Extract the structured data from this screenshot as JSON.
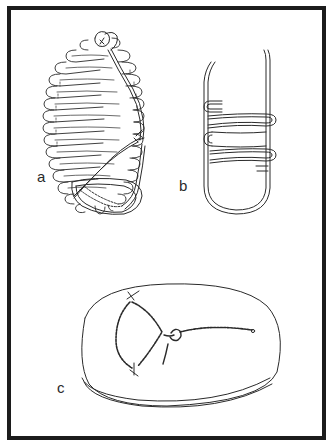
{
  "figure": {
    "panels": [
      {
        "id": "a",
        "label": "a",
        "subject": "coiled-wrapped-bundle-with-cord"
      },
      {
        "id": "b",
        "label": "b",
        "subject": "u-shaped-loop-with-wrapping"
      },
      {
        "id": "c",
        "label": "c",
        "subject": "oval-disc-with-knotted-cord"
      }
    ],
    "colors": {
      "ink": "#2a2a2a",
      "frame": "#1c1c1c",
      "background": "#ffffff"
    }
  }
}
